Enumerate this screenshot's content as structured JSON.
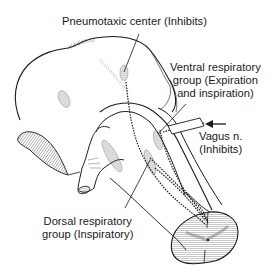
{
  "diagram": {
    "labels": {
      "pneumotaxic": "Pneumotaxic center (Inhibits)",
      "ventral_line1": "Ventral respiratory",
      "ventral_line2": "group (Expiration",
      "ventral_line3": "and inspiration)",
      "vagus_line1": "Vagus n.",
      "vagus_line2": "(Inhibits)",
      "dorsal_line1": "Dorsal respiratory",
      "dorsal_line2": "group (Inspiratory)"
    },
    "colors": {
      "line": "#1a1a1a",
      "hatch": "#555555",
      "background": "#ffffff"
    }
  }
}
